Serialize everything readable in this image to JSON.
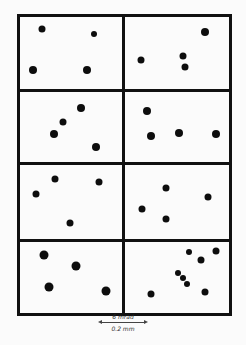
{
  "figure": {
    "frame": {
      "left": 17,
      "top": 14,
      "right": 232,
      "bottom": 316
    },
    "col_divider_x": 122,
    "row_divider_y": [
      89,
      162,
      239
    ],
    "spot_color": "#0d0d0d",
    "line_color": "#111111",
    "panels": [
      {
        "id": "r1c1",
        "spots": [
          [
            42,
            29,
            7
          ],
          [
            94,
            34,
            6
          ],
          [
            33,
            70,
            8
          ],
          [
            87,
            70,
            8
          ]
        ]
      },
      {
        "id": "r1c2",
        "spots": [
          [
            205,
            32,
            8
          ],
          [
            141,
            60,
            7
          ],
          [
            183,
            56,
            7
          ],
          [
            185,
            67,
            7
          ]
        ]
      },
      {
        "id": "r2c1",
        "spots": [
          [
            81,
            108,
            8
          ],
          [
            63,
            122,
            7
          ],
          [
            54,
            134,
            8
          ],
          [
            96,
            147,
            8
          ]
        ]
      },
      {
        "id": "r2c2",
        "spots": [
          [
            147,
            111,
            8
          ],
          [
            151,
            136,
            8
          ],
          [
            179,
            133,
            8
          ],
          [
            216,
            134,
            8
          ]
        ]
      },
      {
        "id": "r3c1",
        "spots": [
          [
            55,
            179,
            7
          ],
          [
            99,
            182,
            7
          ],
          [
            36,
            194,
            7
          ],
          [
            70,
            223,
            7
          ]
        ]
      },
      {
        "id": "r3c2",
        "spots": [
          [
            166,
            188,
            7
          ],
          [
            208,
            197,
            7
          ],
          [
            142,
            209,
            7
          ],
          [
            166,
            219,
            7
          ]
        ]
      },
      {
        "id": "r4c1",
        "spots": [
          [
            44,
            255,
            9
          ],
          [
            76,
            266,
            9
          ],
          [
            49,
            287,
            9
          ],
          [
            106,
            291,
            9
          ]
        ]
      },
      {
        "id": "r4c2",
        "spots": [
          [
            189,
            252,
            6
          ],
          [
            216,
            251,
            7
          ],
          [
            201,
            260,
            7
          ],
          [
            178,
            273,
            6
          ],
          [
            183,
            278,
            6
          ],
          [
            187,
            284,
            6
          ],
          [
            151,
            294,
            7
          ],
          [
            205,
            292,
            7
          ]
        ]
      }
    ]
  },
  "scale_bar": {
    "top_label": "6 mrad",
    "bottom_label": "0.2 mm"
  }
}
